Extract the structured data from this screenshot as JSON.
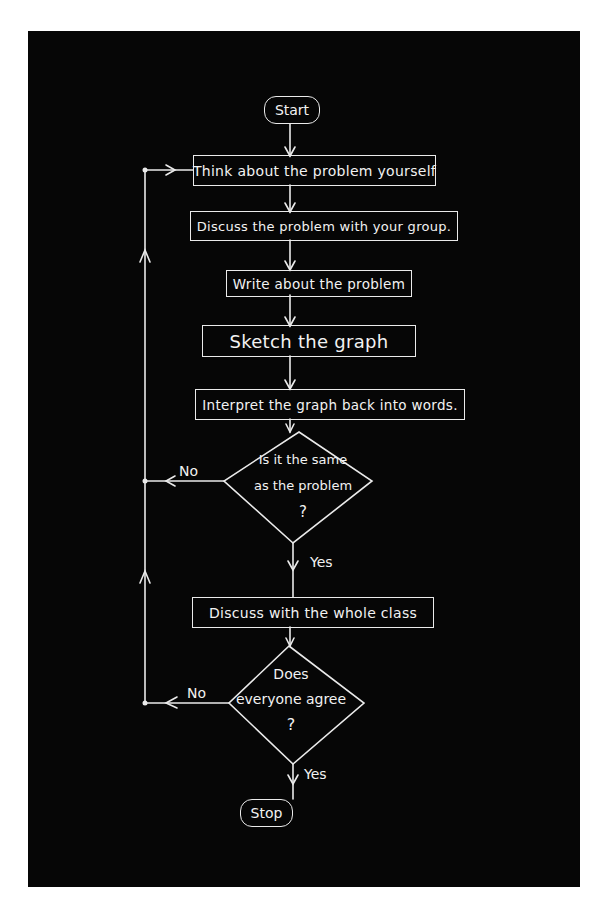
{
  "flowchart": {
    "nodes": {
      "start": {
        "type": "terminal",
        "label": "Start"
      },
      "think": {
        "type": "process",
        "label": "Think about the problem yourself"
      },
      "discuss_group": {
        "type": "process",
        "label": "Discuss the problem with your group."
      },
      "write": {
        "type": "process",
        "label": "Write about the problem"
      },
      "sketch": {
        "type": "process",
        "label": "Sketch the graph"
      },
      "interpret": {
        "type": "process",
        "label": "Interpret the graph back into words."
      },
      "decision_same": {
        "type": "decision",
        "lines": [
          "Is it the same",
          "as the problem",
          "?"
        ]
      },
      "discuss_class": {
        "type": "process",
        "label": "Discuss with the whole class"
      },
      "decision_agree": {
        "type": "decision",
        "lines": [
          "Does",
          "everyone agree",
          "?"
        ]
      },
      "stop": {
        "type": "terminal",
        "label": "Stop"
      }
    },
    "edges": {
      "same_no": "No",
      "same_yes": "Yes",
      "agree_no": "No",
      "agree_yes": "Yes"
    },
    "colors": {
      "background": "#060606",
      "stroke": "#eaeaea",
      "page": "#ffffff"
    }
  }
}
